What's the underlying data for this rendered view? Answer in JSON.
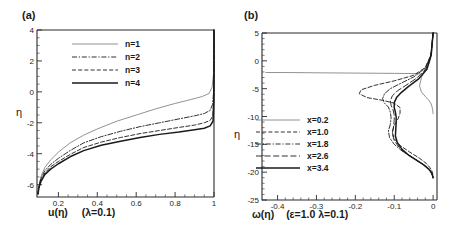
{
  "figure": {
    "panels": [
      {
        "id": "a",
        "label": "(a)",
        "xlabel_main": "u(η)",
        "xlabel_params": "(λ=0.1)",
        "ylabel": "η",
        "xticks": [
          "0.2",
          "0.4",
          "0.6",
          "0.8",
          "1"
        ],
        "yticks": [
          "4",
          "2",
          "0",
          "-2",
          "-4",
          "-6"
        ],
        "legend": [
          {
            "label": "n=1",
            "style": "thin-solid"
          },
          {
            "label": "n=2",
            "style": "dash-dot"
          },
          {
            "label": "n=3",
            "style": "dashed"
          },
          {
            "label": "n=4",
            "style": "thick-solid"
          }
        ]
      },
      {
        "id": "b",
        "label": "(b)",
        "xlabel_main": "ω(η)",
        "xlabel_params": "(ε=1.0 λ=0.1)",
        "ylabel": "η",
        "xticks": [
          "-0.4",
          "-0.3",
          "-0.2",
          "-0.1",
          "0"
        ],
        "yticks": [
          "5",
          "0",
          "-5",
          "-10",
          "-15",
          "-20",
          "-25"
        ],
        "legend": [
          {
            "label": "x=0.2",
            "style": "thin-solid"
          },
          {
            "label": "x=1.0",
            "style": "dashed"
          },
          {
            "label": "x=1.8",
            "style": "dash-dot"
          },
          {
            "label": "x=2.6",
            "style": "long-dashed"
          },
          {
            "label": "x=3.4",
            "style": "thick-solid"
          }
        ]
      }
    ]
  },
  "chart_data": [
    {
      "type": "line",
      "panel": "a",
      "title": "(a)",
      "xlabel": "u(η)  (λ=0.1)",
      "ylabel": "η",
      "xlim": [
        0.09,
        1.0
      ],
      "ylim": [
        -6.8,
        4.0
      ],
      "xticks": [
        0.2,
        0.4,
        0.6,
        0.8,
        1.0
      ],
      "yticks": [
        4,
        2,
        0,
        -2,
        -4,
        -6
      ],
      "grid": false,
      "legend_position": "upper-center",
      "series": [
        {
          "name": "n=1",
          "style": "thin-solid",
          "x": [
            0.095,
            0.1,
            0.11,
            0.13,
            0.16,
            0.2,
            0.26,
            0.33,
            0.4,
            0.5,
            0.6,
            0.7,
            0.8,
            0.88,
            0.94,
            0.975,
            0.99,
            0.998,
            1.0,
            1.0
          ],
          "y": [
            -6.6,
            -6.1,
            -5.5,
            -4.9,
            -4.4,
            -3.9,
            -3.3,
            -2.8,
            -2.4,
            -1.9,
            -1.5,
            -1.1,
            -0.75,
            -0.5,
            -0.3,
            -0.1,
            0.3,
            1.2,
            2.6,
            4.0
          ]
        },
        {
          "name": "n=2",
          "style": "dash-dot",
          "x": [
            0.095,
            0.1,
            0.11,
            0.13,
            0.16,
            0.2,
            0.26,
            0.33,
            0.42,
            0.52,
            0.62,
            0.72,
            0.82,
            0.9,
            0.95,
            0.98,
            0.993,
            0.999,
            1.0,
            1.0
          ],
          "y": [
            -6.6,
            -6.1,
            -5.6,
            -5.1,
            -4.7,
            -4.3,
            -3.8,
            -3.3,
            -2.9,
            -2.55,
            -2.25,
            -2.0,
            -1.75,
            -1.55,
            -1.4,
            -1.2,
            -0.8,
            0.2,
            2.2,
            4.0
          ]
        },
        {
          "name": "n=3",
          "style": "dashed",
          "x": [
            0.095,
            0.1,
            0.11,
            0.13,
            0.16,
            0.2,
            0.26,
            0.33,
            0.42,
            0.52,
            0.62,
            0.72,
            0.82,
            0.9,
            0.95,
            0.98,
            0.994,
            0.999,
            1.0,
            1.0
          ],
          "y": [
            -6.6,
            -6.15,
            -5.7,
            -5.25,
            -4.85,
            -4.5,
            -4.05,
            -3.6,
            -3.25,
            -2.95,
            -2.7,
            -2.5,
            -2.3,
            -2.15,
            -2.0,
            -1.85,
            -1.55,
            -0.4,
            2.0,
            4.0
          ]
        },
        {
          "name": "n=4",
          "style": "thick-solid",
          "x": [
            0.095,
            0.1,
            0.11,
            0.13,
            0.16,
            0.2,
            0.26,
            0.33,
            0.42,
            0.52,
            0.62,
            0.72,
            0.82,
            0.9,
            0.95,
            0.98,
            0.995,
            0.999,
            1.0,
            1.0
          ],
          "y": [
            -6.6,
            -6.2,
            -5.8,
            -5.35,
            -5.0,
            -4.65,
            -4.2,
            -3.8,
            -3.45,
            -3.2,
            -2.95,
            -2.75,
            -2.6,
            -2.45,
            -2.35,
            -2.2,
            -1.9,
            -0.6,
            1.9,
            4.0
          ]
        }
      ]
    },
    {
      "type": "line",
      "panel": "b",
      "title": "(b)",
      "xlabel": "ω(η)  (ε=1.0 λ=0.1)",
      "ylabel": "η",
      "xlim": [
        -0.44,
        0.01
      ],
      "ylim": [
        -25,
        5
      ],
      "xticks": [
        -0.4,
        -0.3,
        -0.2,
        -0.1,
        0.0
      ],
      "yticks": [
        5,
        0,
        -5,
        -10,
        -15,
        -20,
        -25
      ],
      "grid": false,
      "legend_position": "center-left",
      "series": [
        {
          "name": "x=0.2",
          "style": "thin-solid",
          "x": [
            0.0,
            -0.004,
            -0.01,
            -0.02,
            -0.03,
            -0.035,
            -0.03,
            -0.02,
            -0.012,
            -0.006,
            -0.003,
            -0.0015,
            -0.0008,
            -0.0004,
            -0.0002,
            -0.0001,
            0.0,
            0.0
          ],
          "y": [
            5.0,
            1.5,
            -0.4,
            -1.4,
            -3.0,
            -4.5,
            -5.6,
            -6.4,
            -7.0,
            -7.6,
            -8.2,
            -8.7,
            -9.0,
            -9.2,
            -9.3,
            -9.4,
            -9.5,
            -9.5
          ]
        },
        {
          "name": "x=0.2-tail",
          "style": "thin-solid",
          "x": [
            -0.035,
            -0.1,
            -0.2,
            -0.3,
            -0.38,
            -0.425,
            -0.43
          ],
          "y": [
            -2.3,
            -2.25,
            -2.2,
            -2.15,
            -2.1,
            -2.1,
            -2.1
          ]
        },
        {
          "name": "x=1.0",
          "style": "dashed",
          "x": [
            0.0,
            -0.006,
            -0.02,
            -0.05,
            -0.1,
            -0.15,
            -0.185,
            -0.19,
            -0.17,
            -0.13,
            -0.1,
            -0.085,
            -0.085,
            -0.09,
            -0.1,
            -0.105,
            -0.1,
            -0.085,
            -0.06,
            -0.035,
            -0.018,
            -0.008,
            -0.003,
            -0.001,
            0.0,
            0.0
          ],
          "y": [
            5.0,
            1.0,
            -1.2,
            -2.6,
            -3.6,
            -4.4,
            -5.2,
            -5.9,
            -6.6,
            -7.1,
            -7.6,
            -8.4,
            -9.4,
            -10.4,
            -11.6,
            -12.8,
            -14.0,
            -15.2,
            -16.4,
            -17.5,
            -18.4,
            -19.2,
            -19.8,
            -20.3,
            -20.8,
            -21.0
          ]
        },
        {
          "name": "x=1.8",
          "style": "dash-dot",
          "x": [
            0.0,
            -0.006,
            -0.02,
            -0.05,
            -0.085,
            -0.11,
            -0.125,
            -0.13,
            -0.125,
            -0.115,
            -0.11,
            -0.108,
            -0.11,
            -0.115,
            -0.112,
            -0.1,
            -0.08,
            -0.055,
            -0.032,
            -0.016,
            -0.007,
            -0.003,
            -0.001,
            0.0,
            0.0
          ],
          "y": [
            5.0,
            1.0,
            -1.3,
            -2.9,
            -4.1,
            -5.0,
            -5.9,
            -6.8,
            -7.6,
            -8.3,
            -9.2,
            -10.2,
            -11.4,
            -12.6,
            -13.8,
            -15.0,
            -16.2,
            -17.3,
            -18.3,
            -19.1,
            -19.8,
            -20.3,
            -20.7,
            -21.0,
            -21.0
          ]
        },
        {
          "name": "x=2.6",
          "style": "long-dashed",
          "x": [
            0.0,
            -0.005,
            -0.018,
            -0.042,
            -0.07,
            -0.092,
            -0.105,
            -0.11,
            -0.108,
            -0.103,
            -0.1,
            -0.1,
            -0.102,
            -0.105,
            -0.1,
            -0.088,
            -0.07,
            -0.048,
            -0.028,
            -0.014,
            -0.006,
            -0.0025,
            -0.001,
            0.0,
            0.0
          ],
          "y": [
            5.0,
            1.0,
            -1.4,
            -3.1,
            -4.4,
            -5.4,
            -6.3,
            -7.2,
            -8.0,
            -8.8,
            -9.7,
            -10.7,
            -11.9,
            -13.1,
            -14.3,
            -15.5,
            -16.6,
            -17.6,
            -18.5,
            -19.3,
            -19.9,
            -20.4,
            -20.8,
            -21.0,
            -21.0
          ]
        },
        {
          "name": "x=3.4",
          "style": "thick-solid",
          "x": [
            0.0,
            -0.005,
            -0.016,
            -0.038,
            -0.063,
            -0.082,
            -0.094,
            -0.1,
            -0.1,
            -0.097,
            -0.095,
            -0.095,
            -0.096,
            -0.097,
            -0.092,
            -0.08,
            -0.062,
            -0.042,
            -0.024,
            -0.012,
            -0.005,
            -0.002,
            -0.0008,
            0.0,
            0.0
          ],
          "y": [
            5.0,
            1.0,
            -1.5,
            -3.3,
            -4.6,
            -5.7,
            -6.6,
            -7.5,
            -8.4,
            -9.2,
            -10.1,
            -11.1,
            -12.3,
            -13.5,
            -14.7,
            -15.9,
            -17.0,
            -17.9,
            -18.7,
            -19.4,
            -20.0,
            -20.5,
            -20.8,
            -21.0,
            -21.0
          ]
        }
      ]
    }
  ]
}
